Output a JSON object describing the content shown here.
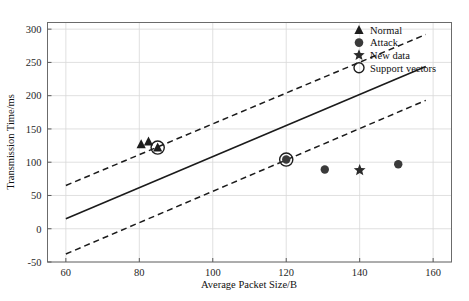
{
  "chart_data": {
    "type": "scatter",
    "title": "",
    "xlabel": "Average Packet Size/B",
    "ylabel": "Transmission Time/ms",
    "xlim": [
      55,
      165
    ],
    "ylim": [
      -50,
      310
    ],
    "xticks": [
      60,
      80,
      100,
      120,
      140,
      160
    ],
    "yticks": [
      -50,
      0,
      50,
      100,
      150,
      200,
      250,
      300
    ],
    "grid": true,
    "legend_position": "top-right",
    "legend": [
      {
        "label": "Normal",
        "marker": "triangle",
        "filled": true
      },
      {
        "label": "Attack",
        "marker": "circle",
        "filled": true
      },
      {
        "label": "New data",
        "marker": "star",
        "filled": true
      },
      {
        "label": "Support vectors",
        "marker": "circle",
        "filled": false
      }
    ],
    "series": [
      {
        "name": "Normal",
        "marker": "triangle",
        "points": [
          {
            "x": 80.5,
            "y": 127
          },
          {
            "x": 82.5,
            "y": 131
          },
          {
            "x": 85.0,
            "y": 122
          }
        ]
      },
      {
        "name": "Attack",
        "marker": "circle",
        "points": [
          {
            "x": 120.0,
            "y": 104
          },
          {
            "x": 130.5,
            "y": 89
          },
          {
            "x": 150.5,
            "y": 97
          }
        ]
      },
      {
        "name": "New data",
        "marker": "star",
        "points": [
          {
            "x": 140.0,
            "y": 88
          }
        ]
      },
      {
        "name": "Support vectors",
        "marker": "open-circle",
        "points": [
          {
            "x": 85.0,
            "y": 122
          },
          {
            "x": 120.0,
            "y": 104
          }
        ]
      }
    ],
    "lines": [
      {
        "name": "decision-boundary",
        "style": "solid",
        "from": {
          "x": 60,
          "y": 15
        },
        "to": {
          "x": 158,
          "y": 244
        }
      },
      {
        "name": "upper-margin",
        "style": "dashed",
        "from": {
          "x": 60,
          "y": 65
        },
        "to": {
          "x": 158,
          "y": 292
        }
      },
      {
        "name": "lower-margin",
        "style": "dashed",
        "from": {
          "x": 60,
          "y": -38
        },
        "to": {
          "x": 158,
          "y": 193
        }
      }
    ]
  }
}
